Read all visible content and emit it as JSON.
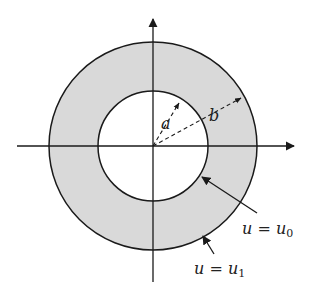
{
  "diagram": {
    "type": "annulus",
    "colors": {
      "fill": "#d9d9d9",
      "stroke": "#1a1a1a",
      "background": "#ffffff"
    },
    "labels": {
      "inner_radius": "a",
      "outer_radius": "b",
      "inner_boundary": {
        "var": "u",
        "eq": " = ",
        "val": "u",
        "sub": "0"
      },
      "outer_boundary": {
        "var": "u",
        "eq": " = ",
        "val": "u",
        "sub": "1"
      }
    }
  }
}
